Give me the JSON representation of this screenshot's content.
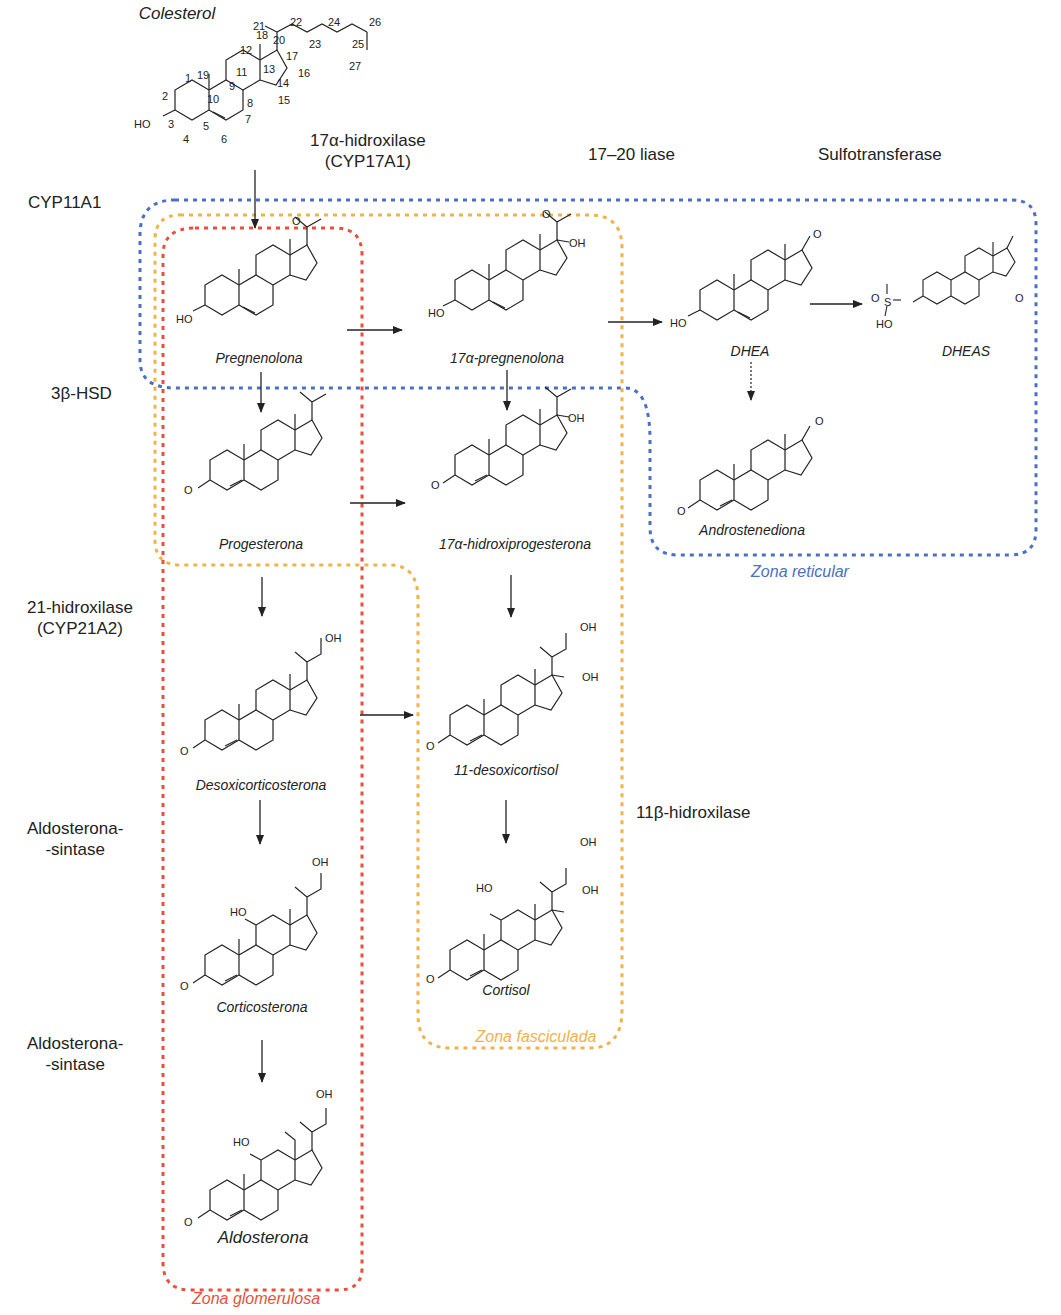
{
  "title": "Colesterol",
  "colors": {
    "zona_reticular": "#4a6fc4",
    "zona_fasciculada": "#f2b24a",
    "zona_glomerulosa": "#e8503a",
    "ink": "#222222"
  },
  "enzymes": {
    "cyp11a1": "CYP11A1",
    "hsd3b": "3β-HSD",
    "hidroxilase21_line1": "21-hidroxilase",
    "hidroxilase21_line2": "(CYP21A2)",
    "aldosintase1_line1": "Aldosterona-",
    "aldosintase1_line2": "-sintase",
    "aldosintase2_line1": "Aldosterona-",
    "aldosintase2_line2": "-sintase",
    "hidroxilase17_line1": "17α-hidroxilase",
    "hidroxilase17_line2": "(CYP17A1)",
    "liase": "17–20 liase",
    "sulfotransferase": "Sulfotransferase",
    "hidroxilase11b": "11β-hidroxilase"
  },
  "compounds": {
    "colesterol": "Colesterol",
    "pregnenolona": "Pregnenolona",
    "pregnenolona17": "17α-pregnenolona",
    "dhea": "DHEA",
    "dheas": "DHEAS",
    "progesterona": "Progesterona",
    "hidroxiprogesterona17": "17α-hidroxiprogesterona",
    "androstenediona": "Androstenediona",
    "desoxicorticosterona": "Desoxicorticosterona",
    "desoxicortisol11": "11-desoxicortisol",
    "corticosterona": "Corticosterona",
    "cortisol": "Cortisol",
    "aldosterona": "Aldosterona"
  },
  "zones": {
    "reticular": "Zona reticular",
    "fasciculada": "Zona fasciculada",
    "glomerulosa": "Zona glomerulosa"
  },
  "cholesterol_atom_numbers": [
    "1",
    "2",
    "3",
    "4",
    "5",
    "6",
    "7",
    "8",
    "9",
    "10",
    "11",
    "12",
    "13",
    "14",
    "15",
    "16",
    "17",
    "18",
    "19",
    "20",
    "21",
    "22",
    "23",
    "24",
    "25",
    "26",
    "27"
  ],
  "atom_labels": {
    "ho": "HO",
    "oh": "OH",
    "o": "O",
    "h": "H",
    "s": "S"
  }
}
